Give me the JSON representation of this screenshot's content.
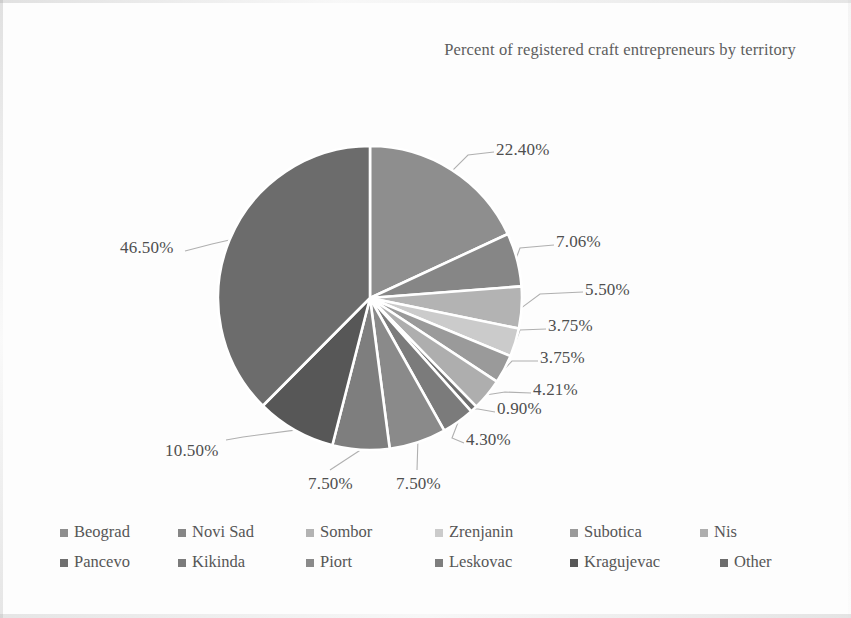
{
  "chart_data": {
    "type": "pie",
    "title": "Percent of registered craft entrepreneurs by territory",
    "xlabel": "",
    "ylabel": "",
    "units": "percent",
    "legend_position": "bottom",
    "grid": false,
    "start_angle_deg": 0,
    "direction": "clockwise",
    "categories": [
      "Beograd",
      "Novi Sad",
      "Sombor",
      "Zrenjanin",
      "Subotica",
      "Nis",
      "Pancevo",
      "Kikinda",
      "Piort",
      "Leskovac",
      "Kragujevac",
      "Other"
    ],
    "values": [
      22.4,
      7.06,
      5.5,
      3.75,
      3.75,
      4.21,
      0.9,
      4.3,
      7.5,
      7.5,
      10.5,
      46.5
    ],
    "value_labels": [
      "22.40%",
      "7.06%",
      "5.50%",
      "3.75%",
      "3.75%",
      "4.21%",
      "0.90%",
      "4.30%",
      "7.50%",
      "7.50%",
      "10.50%",
      "46.50%"
    ],
    "colors": [
      "#8e8e8e",
      "#868686",
      "#b3b3b3",
      "#cbcbcb",
      "#9a9a9a",
      "#aeaeae",
      "#6f6f6f",
      "#7b7b7b",
      "#8a8a8a",
      "#7e7e7e",
      "#575757",
      "#6c6c6c"
    ]
  },
  "title": {
    "text": "Percent of registered craft entrepreneurs by territory"
  },
  "legend": {
    "rows": [
      [
        {
          "label": "Beograd",
          "color": "#8e8e8e"
        },
        {
          "label": "Novi Sad",
          "color": "#868686"
        },
        {
          "label": "Sombor",
          "color": "#b3b3b3"
        },
        {
          "label": "Zrenjanin",
          "color": "#cbcbcb"
        },
        {
          "label": "Subotica",
          "color": "#9a9a9a"
        },
        {
          "label": "Nis",
          "color": "#aeaeae"
        }
      ],
      [
        {
          "label": "Pancevo",
          "color": "#6f6f6f"
        },
        {
          "label": "Kikinda",
          "color": "#7b7b7b"
        },
        {
          "label": "Piort",
          "color": "#8a8a8a"
        },
        {
          "label": "Leskovac",
          "color": "#7e7e7e"
        },
        {
          "label": "Kragujevac",
          "color": "#575757"
        },
        {
          "label": "Other",
          "color": "#6c6c6c"
        }
      ]
    ]
  },
  "labels": [
    {
      "text": "22.40%",
      "x": 496,
      "y": 140
    },
    {
      "text": "7.06%",
      "x": 556,
      "y": 232
    },
    {
      "text": "5.50%",
      "x": 585,
      "y": 280
    },
    {
      "text": "3.75%",
      "x": 548,
      "y": 316
    },
    {
      "text": "3.75%",
      "x": 540,
      "y": 348
    },
    {
      "text": "4.21%",
      "x": 533,
      "y": 380
    },
    {
      "text": "0.90%",
      "x": 497,
      "y": 399
    },
    {
      "text": "4.30%",
      "x": 466,
      "y": 430
    },
    {
      "text": "7.50%",
      "x": 396,
      "y": 474
    },
    {
      "text": "7.50%",
      "x": 308,
      "y": 474
    },
    {
      "text": "10.50%",
      "x": 165,
      "y": 441
    },
    {
      "text": "46.50%",
      "x": 120,
      "y": 238
    }
  ],
  "colors": {
    "background": "#fdfdfd",
    "text": "#4f4f4f",
    "leader_line": "#b0b0b0",
    "slice_border": "#ffffff"
  }
}
